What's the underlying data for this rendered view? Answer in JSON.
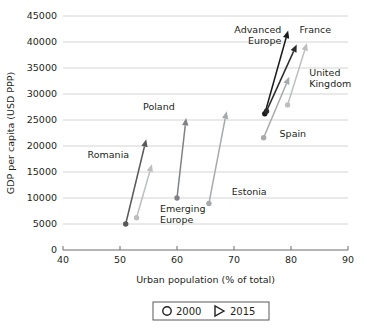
{
  "chart_data": {
    "type": "scatter",
    "title": "",
    "xlabel": "Urban population (% of total)",
    "ylabel": "GDP per capita (USD PPP)",
    "xlim": [
      40,
      90
    ],
    "ylim": [
      0,
      45000
    ],
    "xticks": [
      40,
      50,
      60,
      70,
      80,
      90
    ],
    "yticks": [
      0,
      5000,
      10000,
      15000,
      20000,
      25000,
      30000,
      35000,
      40000,
      45000
    ],
    "grid": "horizontal",
    "legend_position": "bottom-center",
    "legend": [
      {
        "marker": "circle-outline-icon",
        "label": "2000"
      },
      {
        "marker": "triangle-right-icon",
        "label": "2015"
      }
    ],
    "series": [
      {
        "name": "Romania",
        "color": "#58595b",
        "start": {
          "x": 51.0,
          "y": 5000
        },
        "end": {
          "x": 54.6,
          "y": 21300
        },
        "label": "Romania",
        "label_x": 51.6,
        "label_y": 17600,
        "label_anchor": "end"
      },
      {
        "name": "Emerging Europe",
        "color": "#bcbec0",
        "start": {
          "x": 52.9,
          "y": 6200
        },
        "end": {
          "x": 55.6,
          "y": 16500
        },
        "label": "Emerging\nEurope",
        "label_x": 57.0,
        "label_y": 7300,
        "label_anchor": "start"
      },
      {
        "name": "Poland",
        "color": "#808285",
        "start": {
          "x": 60.0,
          "y": 10000
        },
        "end": {
          "x": 61.6,
          "y": 25400
        },
        "label": "Poland",
        "label_x": 59.6,
        "label_y": 27000,
        "label_anchor": "end"
      },
      {
        "name": "Estonia",
        "color": "#a7a9ac",
        "start": {
          "x": 65.6,
          "y": 8950
        },
        "end": {
          "x": 68.7,
          "y": 26700
        },
        "label": "Estonia",
        "label_x": 69.6,
        "label_y": 10600,
        "label_anchor": "start"
      },
      {
        "name": "Advanced Europe",
        "color": "#1a1a1a",
        "start": {
          "x": 75.4,
          "y": 26200
        },
        "end": {
          "x": 79.5,
          "y": 42200
        },
        "label": "Advanced\nEurope",
        "label_x": 78.3,
        "label_y": 41800,
        "label_anchor": "end"
      },
      {
        "name": "France",
        "color": "#2b2b2b",
        "start": {
          "x": 75.7,
          "y": 26700
        },
        "end": {
          "x": 81.0,
          "y": 39500
        },
        "label": "France",
        "label_x": 81.5,
        "label_y": 41700,
        "label_anchor": "start"
      },
      {
        "name": "United Kingdom",
        "color": "#bcbec0",
        "start": {
          "x": 79.4,
          "y": 27900
        },
        "end": {
          "x": 82.8,
          "y": 39800
        },
        "label": "United\nKingdom",
        "label_x": 83.2,
        "label_y": 33400,
        "label_anchor": "start"
      },
      {
        "name": "Spain",
        "color": "#a7a9ac",
        "start": {
          "x": 75.2,
          "y": 21600
        },
        "end": {
          "x": 79.7,
          "y": 33300
        },
        "label": "Spain",
        "label_x": 78.0,
        "label_y": 21800,
        "label_anchor": "start"
      }
    ]
  },
  "colors": {
    "grid": "#c9c9c9",
    "axis": "#6d6d6d",
    "text": "#231f20",
    "background": "#ffffff",
    "legend_border": "#58595b"
  }
}
